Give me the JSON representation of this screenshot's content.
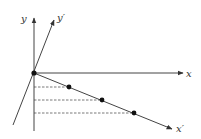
{
  "diagram": {
    "type": "coordinate-rotation",
    "labels": {
      "x": "x",
      "y": "y",
      "x_prime": "x′",
      "y_prime": "y′"
    },
    "origin": [
      34,
      73
    ],
    "axes": {
      "x": {
        "from": [
          34,
          73
        ],
        "to": [
          183,
          73
        ]
      },
      "y": {
        "from": [
          34,
          131
        ],
        "to": [
          34,
          18
        ]
      },
      "x_prime": {
        "from": [
          34,
          73
        ],
        "to": [
          172,
          129
        ]
      },
      "y_prime": {
        "from": [
          13,
          125
        ],
        "to": [
          54,
          20
        ]
      }
    },
    "points": [
      {
        "x": 34,
        "y": 73
      },
      {
        "x": 69,
        "y": 87
      },
      {
        "x": 102,
        "y": 100
      },
      {
        "x": 134,
        "y": 113
      }
    ],
    "projection_lines": [
      {
        "y": 87,
        "x_end": 69
      },
      {
        "y": 100,
        "x_end": 102
      },
      {
        "y": 113,
        "x_end": 134
      }
    ],
    "colors": {
      "axis": "#444444",
      "dot": "#111111",
      "label": "#333333"
    }
  }
}
